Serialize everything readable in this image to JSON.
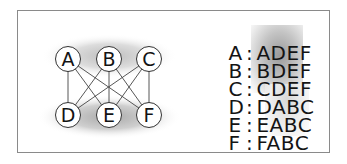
{
  "diagram": {
    "type": "complete-bipartite-graph",
    "name": "K3,3",
    "top_partition": [
      "A",
      "B",
      "C"
    ],
    "bottom_partition": [
      "D",
      "E",
      "F"
    ],
    "nodes": [
      {
        "id": "A",
        "label": "A",
        "x": 68,
        "y": 59
      },
      {
        "id": "B",
        "label": "B",
        "x": 109,
        "y": 59
      },
      {
        "id": "C",
        "label": "C",
        "x": 149,
        "y": 59
      },
      {
        "id": "D",
        "label": "D",
        "x": 68,
        "y": 115
      },
      {
        "id": "E",
        "label": "E",
        "x": 109,
        "y": 115
      },
      {
        "id": "F",
        "label": "F",
        "x": 149,
        "y": 115
      }
    ],
    "edges": [
      [
        "A",
        "D"
      ],
      [
        "A",
        "E"
      ],
      [
        "A",
        "F"
      ],
      [
        "B",
        "D"
      ],
      [
        "B",
        "E"
      ],
      [
        "B",
        "F"
      ],
      [
        "C",
        "D"
      ],
      [
        "C",
        "E"
      ],
      [
        "C",
        "F"
      ]
    ],
    "colors": {
      "frame_border": "#8a8a8a",
      "node_fill": "#ffffff",
      "node_stroke": "#333333",
      "edge": "#444444",
      "text": "#141414",
      "partition_shade": "#b5b5b5"
    }
  },
  "adjacency_list": {
    "rows": [
      {
        "key": "A",
        "sep": ":",
        "list": "ADEF"
      },
      {
        "key": "B",
        "sep": ":",
        "list": "BDEF"
      },
      {
        "key": "C",
        "sep": ":",
        "list": "CDEF"
      },
      {
        "key": "D",
        "sep": ":",
        "list": "DABC"
      },
      {
        "key": "E",
        "sep": ":",
        "list": "EABC"
      },
      {
        "key": "F",
        "sep": ":",
        "list": "FABC"
      }
    ]
  }
}
